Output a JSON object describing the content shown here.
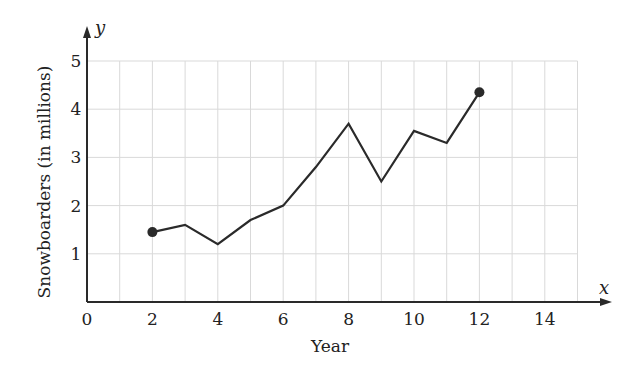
{
  "chart_data": {
    "type": "line",
    "title": "",
    "xlabel": "Year",
    "ylabel": "Snowboarders (in millions)",
    "x_axis_var": "x",
    "y_axis_var": "y",
    "xlim": [
      0,
      15
    ],
    "ylim": [
      0,
      5
    ],
    "xticks": [
      0,
      2,
      4,
      6,
      8,
      10,
      12,
      14
    ],
    "yticks": [
      1,
      2,
      3,
      4,
      5
    ],
    "grid": true,
    "legend": null,
    "series": [
      {
        "name": "Snowboarders",
        "x": [
          2,
          3,
          4,
          5,
          6,
          7,
          8,
          9,
          10,
          11,
          12
        ],
        "values": [
          1.45,
          1.6,
          1.2,
          1.7,
          2.0,
          2.8,
          3.7,
          2.5,
          3.55,
          3.3,
          4.35
        ],
        "endpoint_markers": true
      }
    ]
  },
  "colors": {
    "line": "#2a2a2a",
    "grid": "#d9d9d9",
    "axis": "#2a2a2a"
  }
}
